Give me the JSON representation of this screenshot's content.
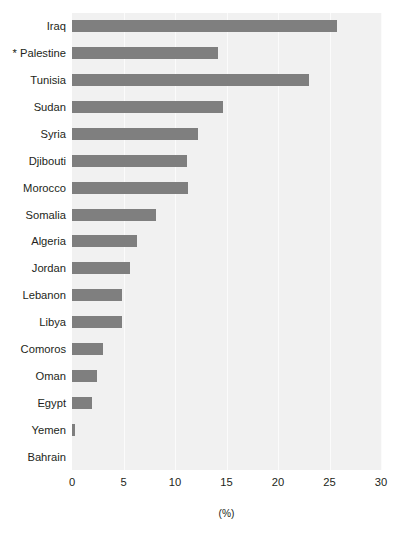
{
  "chart_data": {
    "type": "bar",
    "orientation": "horizontal",
    "title": "",
    "subtitle": "",
    "xlabel": "(%)",
    "ylabel": "",
    "xlim": [
      0,
      30
    ],
    "xticks": [
      0,
      5,
      10,
      15,
      20,
      25,
      30
    ],
    "xticklabels": [
      "0",
      "5",
      "10",
      "15",
      "20",
      "25",
      "30"
    ],
    "grid": true,
    "grid_axis": "x",
    "legend": false,
    "legend_position": "none",
    "categories": [
      "Iraq",
      "* Palestine",
      "Tunisia",
      "Sudan",
      "Syria",
      "Djibouti",
      "Morocco",
      "Somalia",
      "Algeria",
      "Jordan",
      "Lebanon",
      "Libya",
      "Comoros",
      "Oman",
      "Egypt",
      "Yemen",
      "Bahrain"
    ],
    "values": [
      25.7,
      14.2,
      23.0,
      14.7,
      12.2,
      11.2,
      11.3,
      8.2,
      6.3,
      5.6,
      4.9,
      4.9,
      3.0,
      2.4,
      1.9,
      0.3,
      0.0
    ],
    "series": [
      {
        "name": "",
        "values": [
          25.7,
          14.2,
          23.0,
          14.7,
          12.2,
          11.2,
          11.3,
          8.2,
          6.3,
          5.6,
          4.9,
          4.9,
          3.0,
          2.4,
          1.9,
          0.3,
          0.0
        ]
      }
    ]
  },
  "style": {
    "bar_color": "#7f7f7f",
    "plot_background": "#f1f1f1",
    "gridline_color": "#fbfbfb",
    "text_color": "#231f20",
    "page_background": "#ffffff"
  }
}
